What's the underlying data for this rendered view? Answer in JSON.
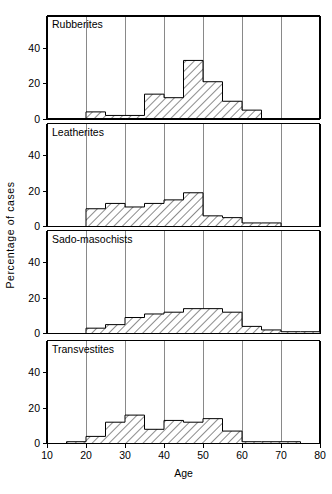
{
  "figure": {
    "xlabel": "Age",
    "ylabel": "Percentage of cases",
    "x_ticks": [
      "10",
      "20",
      "30",
      "40",
      "50",
      "60",
      "70",
      "80"
    ],
    "y_ticks": [
      "0",
      "20",
      "40"
    ]
  },
  "chart_data": {
    "type": "bar",
    "title": "",
    "subtitle": "",
    "xlabel": "Age",
    "ylabel": "Percentage of cases",
    "xlim": [
      10,
      80
    ],
    "ylim": [
      0,
      50
    ],
    "bin_width": 5,
    "bin_starts": [
      10,
      15,
      20,
      25,
      30,
      35,
      40,
      45,
      50,
      55,
      60,
      65,
      70,
      75
    ],
    "grid": "vertical gridlines at every 10 years",
    "legend": "none; each panel labelled in-place at top-left",
    "panels": [
      {
        "name": "Rubberites",
        "label": "Rubberites",
        "values": [
          0,
          0,
          4,
          2,
          2,
          14,
          12,
          33,
          21,
          10,
          5,
          0,
          0,
          0
        ]
      },
      {
        "name": "Leatherites",
        "label": "Leatherites",
        "values": [
          0,
          0,
          10,
          13,
          11,
          13,
          15,
          19,
          6,
          5,
          2,
          2,
          0,
          0
        ]
      },
      {
        "name": "Sado-masochists",
        "label": "Sado-masochists",
        "values": [
          0,
          0,
          3,
          5,
          9,
          11,
          12,
          14,
          14,
          12,
          4,
          2,
          1,
          1
        ]
      },
      {
        "name": "Transvestites",
        "label": "Transvestites",
        "values": [
          0,
          1,
          4,
          12,
          16,
          8,
          13,
          12,
          14,
          7,
          1,
          1,
          1,
          0
        ]
      }
    ]
  }
}
